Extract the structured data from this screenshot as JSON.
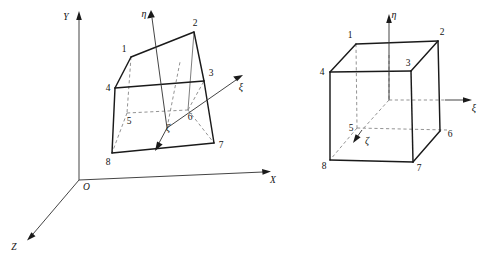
{
  "figure": {
    "background_color": "#ffffff",
    "line_color": "#1a1a1a",
    "hidden_line_color": "#808080",
    "axis_color": "#3a3a3a"
  },
  "left_panel": {
    "caption": "distorted element in global Cartesian space",
    "global_axes": [
      {
        "id": "y-axis",
        "label": "Y"
      },
      {
        "id": "x-axis",
        "label": "X"
      },
      {
        "id": "z-axis",
        "label": "Z"
      }
    ],
    "origin_label": "O",
    "natural_axes": [
      {
        "id": "eta-axis",
        "label": "η"
      },
      {
        "id": "xi-axis",
        "label": "ξ"
      },
      {
        "id": "zeta-axis",
        "label": "ζ"
      }
    ],
    "nodes": [
      {
        "id": 1,
        "label": "1"
      },
      {
        "id": 2,
        "label": "2"
      },
      {
        "id": 3,
        "label": "3"
      },
      {
        "id": 4,
        "label": "4"
      },
      {
        "id": 5,
        "label": "5"
      },
      {
        "id": 6,
        "label": "6"
      },
      {
        "id": 7,
        "label": "7"
      },
      {
        "id": 8,
        "label": "8"
      }
    ]
  },
  "right_panel": {
    "caption": "parent cube element in natural coordinate space",
    "natural_axes": [
      {
        "id": "eta-axis",
        "label": "η"
      },
      {
        "id": "xi-axis",
        "label": "ξ"
      },
      {
        "id": "zeta-axis",
        "label": "ζ"
      }
    ],
    "nodes": [
      {
        "id": 1,
        "label": "1"
      },
      {
        "id": 2,
        "label": "2"
      },
      {
        "id": 3,
        "label": "3"
      },
      {
        "id": 4,
        "label": "4"
      },
      {
        "id": 5,
        "label": "5"
      },
      {
        "id": 6,
        "label": "6"
      },
      {
        "id": 7,
        "label": "7"
      },
      {
        "id": 8,
        "label": "8"
      }
    ]
  }
}
